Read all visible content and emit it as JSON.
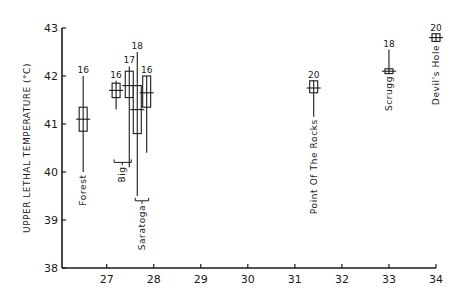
{
  "chart_data": {
    "type": "box",
    "title": "",
    "xlabel": "",
    "ylabel": "UPPER LETHAL TEMPERATURE (°C)",
    "xlim": [
      26.05,
      34
    ],
    "ylim": [
      38,
      43
    ],
    "x_ticks": [
      27,
      28,
      29,
      30,
      31,
      32,
      33,
      34
    ],
    "y_ticks": [
      38,
      39,
      40,
      41,
      42,
      43
    ],
    "grid": false,
    "series": [
      {
        "name": "Forest",
        "group": "Forest",
        "x": 26.5,
        "median": 41.1,
        "q1": 40.85,
        "q3": 41.35,
        "whisker_low": 40.0,
        "whisker_high": 42.0,
        "n": 16
      },
      {
        "name": "Big 1",
        "group": "Big",
        "x": 27.2,
        "median": 41.7,
        "q1": 41.55,
        "q3": 41.85,
        "whisker_low": 41.3,
        "whisker_high": 41.9,
        "n": 16
      },
      {
        "name": "Big 2",
        "group": "Big",
        "x": 27.48,
        "median": 41.8,
        "q1": 41.55,
        "q3": 42.1,
        "whisker_low": 40.1,
        "whisker_high": 42.2,
        "n": 17
      },
      {
        "name": "Saratoga 1",
        "group": "Saratoga",
        "x": 27.65,
        "median": 41.3,
        "q1": 40.8,
        "q3": 41.8,
        "whisker_low": 39.5,
        "whisker_high": 42.5,
        "n": 18
      },
      {
        "name": "Saratoga 2",
        "group": "Saratoga",
        "x": 27.85,
        "median": 41.65,
        "q1": 41.35,
        "q3": 42.0,
        "whisker_low": 40.4,
        "whisker_high": 42.0,
        "n": 16
      },
      {
        "name": "Point Of The Rocks",
        "group": "Point Of The Rocks",
        "x": 31.4,
        "median": 41.75,
        "q1": 41.65,
        "q3": 41.9,
        "whisker_low": 41.15,
        "whisker_high": 41.9,
        "n": 20
      },
      {
        "name": "Scrugg",
        "group": "Scrugg",
        "x": 33.0,
        "median": 42.1,
        "q1": 42.05,
        "q3": 42.15,
        "whisker_low": 42.05,
        "whisker_high": 42.55,
        "n": 18
      },
      {
        "name": "Devil's Hole",
        "group": "Devil's Hole",
        "x": 34.0,
        "median": 42.8,
        "q1": 42.72,
        "q3": 42.88,
        "whisker_low": 42.72,
        "whisker_high": 42.88,
        "n": 20
      }
    ],
    "site_labels": [
      {
        "text": "Forest",
        "x": 26.5,
        "y_top": 39.95
      },
      {
        "text": "Big",
        "x": 27.33,
        "y_top": 40.2,
        "bracket": [
          27.2,
          27.48
        ]
      },
      {
        "text": "Saratoga",
        "x": 27.75,
        "y_top": 39.4,
        "bracket": [
          27.65,
          27.85
        ]
      },
      {
        "text": "Point Of The Rocks",
        "x": 31.4,
        "y_top": 41.1
      },
      {
        "text": "Scrugg",
        "x": 33.0,
        "y_top": 42.0
      },
      {
        "text": "Devil's Hole",
        "x": 34.0,
        "y_top": 42.65
      }
    ]
  }
}
